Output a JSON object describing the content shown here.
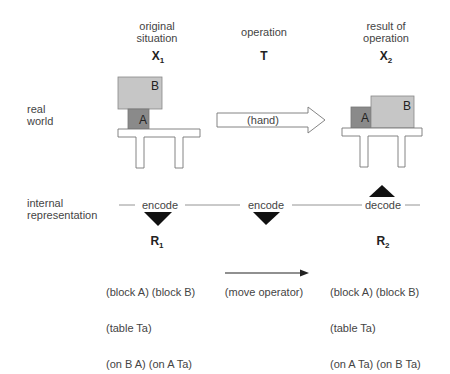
{
  "columns": {
    "original": {
      "heading": "original\nsituation",
      "symbol": "X",
      "subscript": "1"
    },
    "operation": {
      "heading": "operation",
      "symbol": "T",
      "subscript": ""
    },
    "result": {
      "heading": "result of\noperation",
      "symbol": "X",
      "subscript": "2"
    }
  },
  "rows": {
    "real_world": "real\nworld",
    "internal_representation": "internal\nrepresentation"
  },
  "real_world": {
    "original": {
      "block_top": "B",
      "block_bottom": "A"
    },
    "hand_arrow_label": "(hand)",
    "result": {
      "block_left": "A",
      "block_right": "B"
    }
  },
  "internal": {
    "encode_left": "encode",
    "encode_middle": "encode",
    "decode_right": "decode"
  },
  "representations": {
    "r1": {
      "symbol": "R",
      "subscript": "1",
      "lines": [
        "(block A) (block B)",
        "(table Ta)",
        "(on B A) (on A Ta)"
      ]
    },
    "move_label": "(move operator)",
    "r2": {
      "symbol": "R",
      "subscript": "2",
      "lines": [
        "(block A) (block B)",
        "(table Ta)",
        "(on A Ta) (on B Ta)"
      ]
    }
  },
  "colors": {
    "block_light": "#c6c6c6",
    "block_dark": "#8a8a8a",
    "outline": "#777777",
    "triangle": "#111111"
  }
}
